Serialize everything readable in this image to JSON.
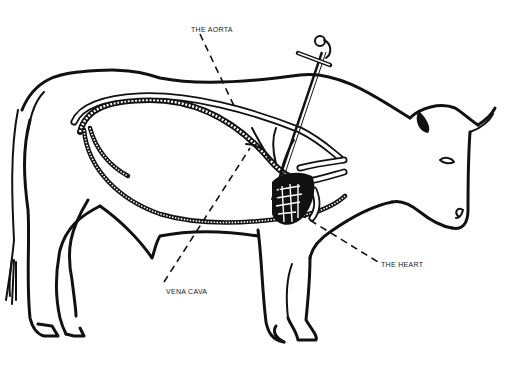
{
  "diagram": {
    "colors": {
      "ink": "#111111",
      "background": "#ffffff"
    },
    "labels": [
      {
        "id": "aorta",
        "text": "THE AORTA",
        "x": 191,
        "y": 26
      },
      {
        "id": "vena_cava",
        "text": "VENA CAVA",
        "x": 166,
        "y": 288
      },
      {
        "id": "heart",
        "text": "THE HEART",
        "x": 381,
        "y": 261
      }
    ]
  }
}
